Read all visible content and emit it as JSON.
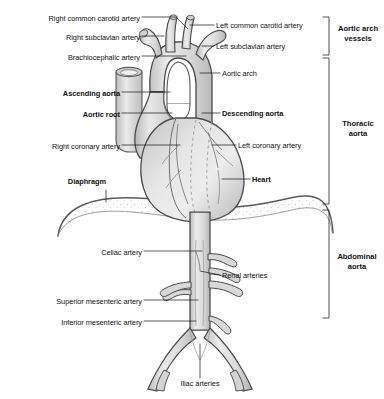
{
  "diagram": {
    "colors": {
      "vessel_fill_light": "#e8e8e8",
      "vessel_fill_mid": "#d5d5d5",
      "vessel_fill_dark": "#bdbdbd",
      "heart_fill": "#dcdcdc",
      "outline": "#4a4a4a",
      "leader_line": "#222222",
      "text": "#111111",
      "background": "#ffffff",
      "stipple": "#c9c9c9"
    }
  },
  "labels_left": [
    {
      "id": "right-common-carotid-artery",
      "text": "Right common carotid artery",
      "bold": false,
      "x": 4,
      "y": 14,
      "width": 136
    },
    {
      "id": "right-subclavian-artery",
      "text": "Right subclavian artery",
      "bold": false,
      "x": 4,
      "y": 33,
      "width": 136
    },
    {
      "id": "brachiocephalic-artery",
      "text": "Brachiocephalic artery",
      "bold": false,
      "x": 4,
      "y": 53,
      "width": 136
    },
    {
      "id": "ascending-aorta",
      "text": "Ascending aorta",
      "bold": true,
      "x": 4,
      "y": 89,
      "width": 116
    },
    {
      "id": "aortic-root",
      "text": "Aortic root",
      "bold": true,
      "x": 4,
      "y": 110,
      "width": 116
    },
    {
      "id": "right-coronary-artery",
      "text": "Right coronary artery",
      "bold": false,
      "x": 4,
      "y": 142,
      "width": 116
    },
    {
      "id": "diaphragm",
      "text": "Diaphragm",
      "bold": true,
      "x": 4,
      "y": 177,
      "width": 102
    },
    {
      "id": "celiac-artery",
      "text": "Celiac artery",
      "bold": false,
      "x": 40,
      "y": 248,
      "width": 102
    },
    {
      "id": "superior-mesenteric-artery",
      "text": "Superior mesenteric artery",
      "bold": false,
      "x": 20,
      "y": 297,
      "width": 122
    },
    {
      "id": "inferior-mesenteric-artery",
      "text": "Inferior mesenteric artery",
      "bold": false,
      "x": 20,
      "y": 318,
      "width": 122
    }
  ],
  "labels_right": [
    {
      "id": "left-common-carotid-artery",
      "text": "Left common carotid artery",
      "bold": false,
      "x": 216,
      "y": 22
    },
    {
      "id": "left-subclavian-artery",
      "text": "Left subclavian artery",
      "bold": false,
      "x": 216,
      "y": 43
    },
    {
      "id": "aortic-arch",
      "text": "Aortic arch",
      "bold": false,
      "x": 222,
      "y": 70
    },
    {
      "id": "descending-aorta",
      "text": "Descending aorta",
      "bold": true,
      "x": 222,
      "y": 110
    },
    {
      "id": "left-coronary-artery",
      "text": "Left coronary artery",
      "bold": false,
      "x": 238,
      "y": 142
    },
    {
      "id": "heart",
      "text": "Heart",
      "bold": true,
      "x": 252,
      "y": 176
    },
    {
      "id": "renal-arteries",
      "text": "Renal arteries",
      "bold": false,
      "x": 222,
      "y": 272
    }
  ],
  "labels_bottom": [
    {
      "id": "iliac-arteries",
      "text": "Iliac arteries",
      "bold": false,
      "x": 155,
      "y": 381
    }
  ],
  "brackets": [
    {
      "id": "aortic-arch-vessels",
      "line1": "Aortic arch",
      "line2": "vessels",
      "top": 17,
      "bottom": 55,
      "label_y": 24
    },
    {
      "id": "thoracic-aorta",
      "line1": "Thoracic",
      "line2": "aorta",
      "top": 58,
      "bottom": 204,
      "label_y": 120
    },
    {
      "id": "abdominal-aorta",
      "line1": "Abdominal",
      "line2": "aorta",
      "top": 210,
      "bottom": 318,
      "label_y": 253
    }
  ]
}
